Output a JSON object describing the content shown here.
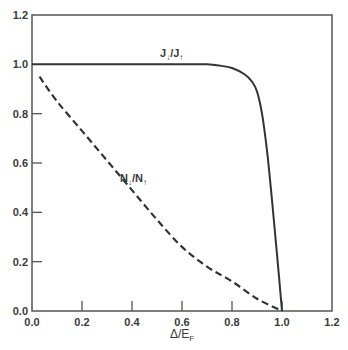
{
  "chart_data": {
    "type": "line",
    "title": "",
    "xlabel": "Δ/E_F",
    "ylabel": "",
    "xlim": [
      0.0,
      1.2
    ],
    "ylim": [
      0.0,
      1.2
    ],
    "grid": false,
    "legend": "inline labels",
    "x_ticks": [
      "0.0",
      "0.2",
      "0.4",
      "0.6",
      "0.8",
      "1.0",
      "1.2"
    ],
    "y_ticks": [
      "0.0",
      "0.2",
      "0.4",
      "0.6",
      "0.8",
      "1.0",
      "1.2"
    ],
    "series": [
      {
        "name": "J↓/J↑",
        "style": "solid",
        "x": [
          0.0,
          0.2,
          0.4,
          0.6,
          0.7,
          0.75,
          0.8,
          0.85,
          0.88,
          0.9,
          0.92,
          0.94,
          0.96,
          0.98,
          1.0
        ],
        "y": [
          1.0,
          1.0,
          1.0,
          1.0,
          1.0,
          0.995,
          0.985,
          0.96,
          0.93,
          0.89,
          0.8,
          0.65,
          0.45,
          0.23,
          0.0
        ]
      },
      {
        "name": "N↓/N↑",
        "style": "dashed",
        "x": [
          0.03,
          0.1,
          0.2,
          0.3,
          0.4,
          0.5,
          0.6,
          0.7,
          0.8,
          0.9,
          1.0
        ],
        "y": [
          0.95,
          0.85,
          0.73,
          0.61,
          0.49,
          0.37,
          0.26,
          0.18,
          0.12,
          0.05,
          0.0
        ]
      }
    ],
    "annotations": [
      {
        "text": "J↓/J↑",
        "x": 0.5,
        "y": 1.03
      },
      {
        "text": "N↓/N↑",
        "x": 0.38,
        "y": 0.62
      }
    ]
  },
  "labels": {
    "x_axis_title_main": "Δ/E",
    "x_axis_title_sub": "F",
    "j_label_main": "J",
    "j_label_arrow1": "↓",
    "j_label_slash": "/J",
    "j_label_arrow2": "↑",
    "n_label_main": "N",
    "n_label_arrow1": "↓",
    "n_label_slash": "/N",
    "n_label_arrow2": "↑"
  },
  "colors": {
    "axis": "#555555",
    "line": "#333333",
    "background": "#ffffff"
  }
}
